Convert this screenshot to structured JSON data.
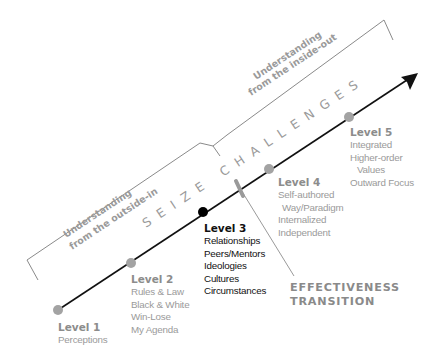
{
  "diagram": {
    "title_arc": "SEIZE CHALLENGES",
    "brackets": {
      "outside_in": {
        "line1": "Understanding",
        "line2": "from the outside-in"
      },
      "inside_out": {
        "line1": "Understanding",
        "line2": "from the inside-out"
      }
    },
    "levels": [
      {
        "title": "Level 1",
        "items": [
          "Perceptions"
        ],
        "highlighted": false
      },
      {
        "title": "Level 2",
        "items": [
          "Rules & Law",
          "Black & White",
          "Win-Lose",
          "My Agenda"
        ],
        "highlighted": false
      },
      {
        "title": "Level 3",
        "items": [
          "Relationships",
          "Peers/Mentors",
          "Ideologies",
          "Cultures",
          "Circumstances"
        ],
        "highlighted": true
      },
      {
        "title": "Level 4",
        "items": [
          "Self-authored",
          "Way/Paradigm",
          "Internalized",
          "Independent"
        ],
        "highlighted": false
      },
      {
        "title": "Level 5",
        "items": [
          "Integrated",
          "Higher-order",
          "Values",
          "Outward Focus"
        ],
        "highlighted": false
      }
    ],
    "transition": {
      "line1": "EFFECTIVENESS",
      "line2": "TRANSITION"
    },
    "colors": {
      "line": "#111111",
      "dot_grey": "#a3a3a3",
      "dot_active": "#000000",
      "bracket": "#8a8a8a",
      "text_grey": "#9a9a9a"
    }
  }
}
